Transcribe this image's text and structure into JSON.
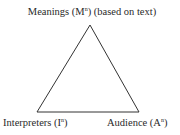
{
  "diagram": {
    "type": "triangle",
    "stroke_color": "#333333",
    "vertices": {
      "top": {
        "name": "Meanings",
        "symbol": "M",
        "superscript": "n",
        "note": "(based on text)"
      },
      "bottom_left": {
        "name": "Interpreters",
        "symbol": "I",
        "superscript": "n"
      },
      "bottom_right": {
        "name": "Audience",
        "symbol": "A",
        "superscript": "n"
      }
    },
    "labels": {
      "top_prefix": "Meanings (M",
      "top_sup": "n",
      "top_suffix": ") (based on text)",
      "left_prefix": "Interpreters (I",
      "left_sup": "n",
      "left_suffix": ")",
      "right_prefix": "Audience (A",
      "right_sup": "n",
      "right_suffix": ")"
    }
  }
}
